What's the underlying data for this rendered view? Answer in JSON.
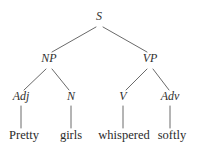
{
  "figure": {
    "kind": "syntax-tree",
    "sentence": "Pretty girls whispered softly",
    "background_color": "#ffffff",
    "edge_color": "#6a6a6a",
    "text_color": "#2b2b2b"
  },
  "nodes": {
    "root": {
      "label": "S",
      "x": 99,
      "y": 20
    },
    "np": {
      "label": "NP",
      "x": 49,
      "y": 62
    },
    "vp": {
      "label": "VP",
      "x": 150,
      "y": 62
    },
    "adj": {
      "label": "Adj",
      "x": 21,
      "y": 100
    },
    "n": {
      "label": "N",
      "x": 71,
      "y": 100
    },
    "v": {
      "label": "V",
      "x": 123,
      "y": 100
    },
    "adv": {
      "label": "Adv",
      "x": 170,
      "y": 100
    },
    "w_pretty": {
      "label": "Pretty",
      "x": 24,
      "y": 140
    },
    "w_girls": {
      "label": "girls",
      "x": 71,
      "y": 140
    },
    "w_whispered": {
      "label": "whispered",
      "x": 124,
      "y": 140
    },
    "w_softly": {
      "label": "softly",
      "x": 172,
      "y": 140
    }
  },
  "edges": [
    {
      "name": "s-to-np",
      "x1": 96,
      "y1": 27,
      "x2": 52,
      "y2": 52
    },
    {
      "name": "s-to-vp",
      "x1": 103,
      "y1": 27,
      "x2": 147,
      "y2": 52
    },
    {
      "name": "np-to-adj",
      "x1": 46,
      "y1": 69,
      "x2": 24,
      "y2": 90
    },
    {
      "name": "np-to-n",
      "x1": 52,
      "y1": 69,
      "x2": 69,
      "y2": 90
    },
    {
      "name": "vp-to-v",
      "x1": 147,
      "y1": 69,
      "x2": 126,
      "y2": 90
    },
    {
      "name": "vp-to-adv",
      "x1": 153,
      "y1": 69,
      "x2": 169,
      "y2": 90
    },
    {
      "name": "adj-to-pretty",
      "x1": 21,
      "y1": 106,
      "x2": 21,
      "y2": 128
    },
    {
      "name": "n-to-girls",
      "x1": 71,
      "y1": 106,
      "x2": 71,
      "y2": 128
    },
    {
      "name": "v-to-whispered",
      "x1": 123,
      "y1": 106,
      "x2": 123,
      "y2": 128
    },
    {
      "name": "adv-to-softly",
      "x1": 170,
      "y1": 106,
      "x2": 170,
      "y2": 128
    }
  ]
}
